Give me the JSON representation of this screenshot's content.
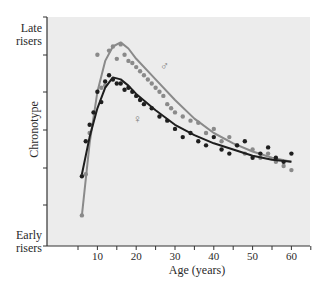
{
  "chart_data": {
    "type": "scatter",
    "title": "",
    "xlabel": "Age (years)",
    "ylabel": "Chronotype",
    "y_top_label": "Late risers",
    "y_bottom_label": "Early risers",
    "xlim": [
      5,
      65
    ],
    "ylim": [
      0,
      1
    ],
    "xticks": [
      10,
      20,
      30,
      40,
      50,
      60
    ],
    "grid": false,
    "legend": "inline symbols on curves",
    "series": [
      {
        "name": "Male",
        "symbol": "♂",
        "color": "#8a8a8a",
        "fit_curve": [
          [
            6,
            0.1
          ],
          [
            8,
            0.45
          ],
          [
            10,
            0.7
          ],
          [
            12,
            0.85
          ],
          [
            14,
            0.92
          ],
          [
            16,
            0.94
          ],
          [
            18,
            0.91
          ],
          [
            20,
            0.86
          ],
          [
            25,
            0.76
          ],
          [
            30,
            0.66
          ],
          [
            35,
            0.57
          ],
          [
            40,
            0.5
          ],
          [
            45,
            0.45
          ],
          [
            50,
            0.41
          ],
          [
            55,
            0.38
          ],
          [
            60,
            0.36
          ]
        ],
        "points": [
          [
            6,
            0.1
          ],
          [
            7,
            0.3
          ],
          [
            8,
            0.5
          ],
          [
            10,
            0.88
          ],
          [
            11,
            0.72
          ],
          [
            12,
            0.73
          ],
          [
            13,
            0.9
          ],
          [
            14,
            0.92
          ],
          [
            15,
            0.86
          ],
          [
            16,
            0.93
          ],
          [
            17,
            0.88
          ],
          [
            18,
            0.85
          ],
          [
            19,
            0.84
          ],
          [
            20,
            0.82
          ],
          [
            21,
            0.8
          ],
          [
            22,
            0.78
          ],
          [
            23,
            0.76
          ],
          [
            24,
            0.74
          ],
          [
            25,
            0.72
          ],
          [
            26,
            0.7
          ],
          [
            27,
            0.68
          ],
          [
            28,
            0.64
          ],
          [
            29,
            0.62
          ],
          [
            30,
            0.6
          ],
          [
            32,
            0.58
          ],
          [
            34,
            0.56
          ],
          [
            36,
            0.55
          ],
          [
            38,
            0.5
          ],
          [
            40,
            0.52
          ],
          [
            42,
            0.46
          ],
          [
            44,
            0.48
          ],
          [
            46,
            0.44
          ],
          [
            48,
            0.4
          ],
          [
            50,
            0.42
          ],
          [
            52,
            0.38
          ],
          [
            54,
            0.4
          ],
          [
            56,
            0.36
          ],
          [
            58,
            0.34
          ],
          [
            60,
            0.32
          ]
        ]
      },
      {
        "name": "Female",
        "symbol": "♀",
        "color": "#1e1e1e",
        "fit_curve": [
          [
            6,
            0.3
          ],
          [
            8,
            0.48
          ],
          [
            10,
            0.62
          ],
          [
            12,
            0.72
          ],
          [
            14,
            0.77
          ],
          [
            16,
            0.76
          ],
          [
            18,
            0.73
          ],
          [
            20,
            0.69
          ],
          [
            25,
            0.61
          ],
          [
            30,
            0.54
          ],
          [
            35,
            0.49
          ],
          [
            40,
            0.45
          ],
          [
            45,
            0.42
          ],
          [
            50,
            0.39
          ],
          [
            55,
            0.37
          ],
          [
            60,
            0.36
          ]
        ],
        "points": [
          [
            6,
            0.29
          ],
          [
            7,
            0.46
          ],
          [
            8,
            0.54
          ],
          [
            9,
            0.6
          ],
          [
            10,
            0.7
          ],
          [
            11,
            0.65
          ],
          [
            12,
            0.75
          ],
          [
            13,
            0.78
          ],
          [
            14,
            0.76
          ],
          [
            15,
            0.74
          ],
          [
            16,
            0.74
          ],
          [
            17,
            0.71
          ],
          [
            18,
            0.72
          ],
          [
            19,
            0.7
          ],
          [
            20,
            0.68
          ],
          [
            21,
            0.66
          ],
          [
            22,
            0.64
          ],
          [
            24,
            0.62
          ],
          [
            26,
            0.58
          ],
          [
            28,
            0.56
          ],
          [
            30,
            0.52
          ],
          [
            32,
            0.48
          ],
          [
            34,
            0.5
          ],
          [
            36,
            0.46
          ],
          [
            38,
            0.44
          ],
          [
            40,
            0.48
          ],
          [
            42,
            0.42
          ],
          [
            44,
            0.4
          ],
          [
            46,
            0.44
          ],
          [
            48,
            0.46
          ],
          [
            50,
            0.38
          ],
          [
            52,
            0.4
          ],
          [
            54,
            0.43
          ],
          [
            56,
            0.38
          ],
          [
            58,
            0.36
          ],
          [
            60,
            0.4
          ]
        ]
      }
    ]
  },
  "labels": {
    "late_1": "Late",
    "late_2": "risers",
    "early_1": "Early",
    "early_2": "risers",
    "ylabel": "Chronotype",
    "xlabel": "Age (years)",
    "xticks": [
      "10",
      "20",
      "30",
      "40",
      "50",
      "60"
    ],
    "male_symbol": "♂",
    "female_symbol": "♀"
  }
}
